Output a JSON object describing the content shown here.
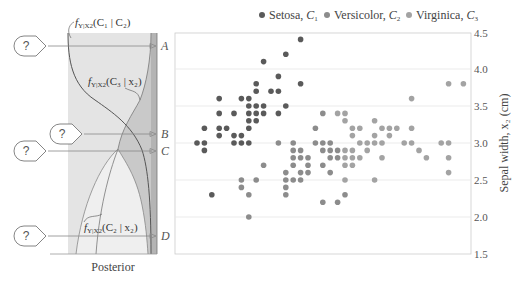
{
  "chart_data": [
    {
      "type": "area",
      "title": "Posterior",
      "orientation": "vertical (y = sepal width x2)",
      "series": [
        {
          "name": "f_{Y|X2}(C1 | x2)",
          "label": "f_Y|X2(C1 | C2)",
          "fill": "#dcdcdc"
        },
        {
          "name": "f_{Y|X2}(C3 | x2)",
          "fill": "#b9b9b9"
        },
        {
          "name": "f_{Y|X2}(C2 | x2)",
          "fill": "#ececec"
        }
      ],
      "query_points": [
        {
          "label": "A",
          "x2": 4.35
        },
        {
          "label": "B",
          "x2": 3.15
        },
        {
          "label": "C",
          "x2": 2.93
        },
        {
          "label": "D",
          "x2": 1.75
        }
      ],
      "query_marker": "?"
    },
    {
      "type": "scatter",
      "title": "",
      "xlabel": "",
      "ylabel": "Sepal width, x2 (cm)",
      "ylim": [
        1.5,
        4.5
      ],
      "xlim": [
        4.0,
        8.0
      ],
      "yticks": [
        "1.5",
        "2.0",
        "2.5",
        "3.0",
        "3.5",
        "4.0",
        "4.5"
      ],
      "grid": "horizontal",
      "legend_position": "top",
      "legend": [
        "Setosa, C1",
        "Versicolor, C2",
        "Virginica, C3"
      ],
      "series": [
        {
          "name": "Setosa, C1",
          "color": "#5a5a5a",
          "points": [
            [
              5.7,
              4.4
            ],
            [
              5.5,
              4.2
            ],
            [
              5.2,
              4.1
            ],
            [
              5.4,
              3.9
            ],
            [
              5.7,
              3.8
            ],
            [
              5.1,
              3.8
            ],
            [
              5.1,
              3.7
            ],
            [
              5.3,
              3.7
            ],
            [
              5.4,
              3.7
            ],
            [
              4.6,
              3.6
            ],
            [
              4.9,
              3.6
            ],
            [
              5.0,
              3.6
            ],
            [
              5.0,
              3.5
            ],
            [
              5.1,
              3.5
            ],
            [
              5.2,
              3.5
            ],
            [
              5.5,
              3.5
            ],
            [
              4.6,
              3.4
            ],
            [
              4.8,
              3.4
            ],
            [
              5.0,
              3.4
            ],
            [
              5.1,
              3.4
            ],
            [
              5.2,
              3.4
            ],
            [
              5.4,
              3.4
            ],
            [
              5.0,
              3.3
            ],
            [
              5.1,
              3.3
            ],
            [
              4.4,
              3.2
            ],
            [
              4.6,
              3.2
            ],
            [
              4.7,
              3.2
            ],
            [
              5.0,
              3.2
            ],
            [
              4.6,
              3.1
            ],
            [
              4.8,
              3.1
            ],
            [
              4.9,
              3.1
            ],
            [
              4.3,
              3.0
            ],
            [
              4.4,
              3.0
            ],
            [
              4.8,
              3.0
            ],
            [
              4.9,
              3.0
            ],
            [
              5.0,
              3.0
            ],
            [
              4.4,
              2.9
            ],
            [
              4.5,
              2.3
            ]
          ]
        },
        {
          "name": "Versicolor, C2",
          "color": "#8c8c8c",
          "points": [
            [
              5.4,
              3.0
            ],
            [
              5.6,
              3.0
            ],
            [
              5.9,
              3.2
            ],
            [
              6.0,
              3.4
            ],
            [
              6.1,
              3.0
            ],
            [
              5.6,
              2.9
            ],
            [
              5.7,
              2.9
            ],
            [
              6.0,
              2.9
            ],
            [
              6.1,
              2.9
            ],
            [
              6.2,
              2.9
            ],
            [
              5.6,
              2.8
            ],
            [
              5.7,
              2.8
            ],
            [
              5.8,
              2.8
            ],
            [
              6.1,
              2.8
            ],
            [
              6.2,
              2.8
            ],
            [
              5.2,
              2.7
            ],
            [
              5.6,
              2.7
            ],
            [
              5.8,
              2.7
            ],
            [
              6.0,
              2.7
            ],
            [
              5.5,
              2.6
            ],
            [
              5.7,
              2.6
            ],
            [
              5.8,
              2.6
            ],
            [
              6.1,
              2.6
            ],
            [
              4.9,
              2.5
            ],
            [
              5.1,
              2.5
            ],
            [
              5.5,
              2.5
            ],
            [
              5.6,
              2.5
            ],
            [
              5.7,
              2.5
            ],
            [
              4.9,
              2.4
            ],
            [
              5.5,
              2.4
            ],
            [
              5.0,
              2.3
            ],
            [
              5.5,
              2.3
            ],
            [
              6.3,
              2.3
            ],
            [
              6.0,
              2.2
            ],
            [
              6.2,
              2.2
            ],
            [
              5.0,
              2.0
            ],
            [
              5.9,
              3.0
            ],
            [
              6.0,
              3.0
            ]
          ]
        },
        {
          "name": "Virginica, C3",
          "color": "#a3a3a3",
          "points": [
            [
              7.7,
              3.8
            ],
            [
              7.9,
              3.8
            ],
            [
              7.2,
              3.6
            ],
            [
              6.2,
              3.4
            ],
            [
              6.3,
              3.4
            ],
            [
              6.3,
              3.3
            ],
            [
              6.7,
              3.3
            ],
            [
              6.4,
              3.2
            ],
            [
              6.5,
              3.2
            ],
            [
              6.8,
              3.2
            ],
            [
              6.9,
              3.2
            ],
            [
              7.0,
              3.2
            ],
            [
              7.2,
              3.2
            ],
            [
              6.4,
              3.1
            ],
            [
              6.7,
              3.1
            ],
            [
              6.9,
              3.1
            ],
            [
              6.5,
              3.0
            ],
            [
              6.6,
              3.0
            ],
            [
              6.7,
              3.0
            ],
            [
              6.8,
              3.0
            ],
            [
              7.1,
              3.0
            ],
            [
              7.2,
              3.0
            ],
            [
              7.6,
              3.0
            ],
            [
              7.7,
              3.0
            ],
            [
              6.3,
              2.9
            ],
            [
              6.4,
              2.9
            ],
            [
              6.6,
              2.9
            ],
            [
              7.3,
              2.9
            ],
            [
              6.3,
              2.8
            ],
            [
              6.4,
              2.8
            ],
            [
              6.5,
              2.8
            ],
            [
              6.8,
              2.8
            ],
            [
              7.4,
              2.8
            ],
            [
              7.7,
              2.8
            ],
            [
              6.3,
              2.7
            ],
            [
              6.4,
              2.7
            ],
            [
              7.7,
              2.6
            ],
            [
              6.3,
              2.5
            ],
            [
              6.7,
              2.5
            ]
          ]
        }
      ]
    }
  ],
  "legend": {
    "items": [
      {
        "label": "Setosa, ",
        "sub": "C",
        "idx": "1",
        "color": "#5a5a5a"
      },
      {
        "label": "Versicolor, ",
        "sub": "C",
        "idx": "2",
        "color": "#8c8c8c"
      },
      {
        "label": "Virginica, ",
        "sub": "C",
        "idx": "3",
        "color": "#a3a3a3"
      }
    ]
  },
  "axis": {
    "yticks": [
      "4.5",
      "4.0",
      "3.5",
      "3.0",
      "2.5",
      "2.0",
      "1.5"
    ],
    "ylabel": "Sepal width, x₂ (cm)"
  },
  "posterior": {
    "title": "Posterior",
    "labels": {
      "c1": "fᵧ|ₓ₂(C₁ | C₂)",
      "c3": "fᵧ|ₓ₂(C₃ | x₂)",
      "c2": "fᵧ|ₓ₂(C₂ | x₂)"
    },
    "label_parts": {
      "c1": {
        "f": "f",
        "sub": "Y|X2",
        "arg": "(C₁ | C₂)"
      },
      "c3": {
        "f": "f",
        "sub": "Y|X2",
        "arg": "(C₃ | x₂)"
      },
      "c2": {
        "f": "f",
        "sub": "Y|X2",
        "arg": "(C₂ | x₂)"
      }
    },
    "queries": [
      {
        "letter": "A",
        "mark": "?"
      },
      {
        "letter": "B",
        "mark": "?"
      },
      {
        "letter": "C",
        "mark": "?"
      },
      {
        "letter": "D",
        "mark": "?"
      }
    ]
  }
}
